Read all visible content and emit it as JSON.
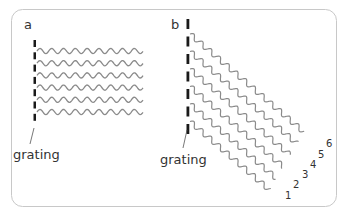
{
  "figure": {
    "frame_color": "#c8c8c8",
    "wave_color": "#8a8a8a",
    "grating_color": "#1a1a1a",
    "panel_a": {
      "label": "a",
      "grating_label": "grating",
      "wave_count": 6,
      "orientation": "horizontal"
    },
    "panel_b": {
      "label": "b",
      "grating_label": "grating",
      "wave_count": 6,
      "orientation": "diagonal",
      "order_labels": [
        "1",
        "2",
        "3",
        "4",
        "5",
        "6"
      ]
    }
  }
}
